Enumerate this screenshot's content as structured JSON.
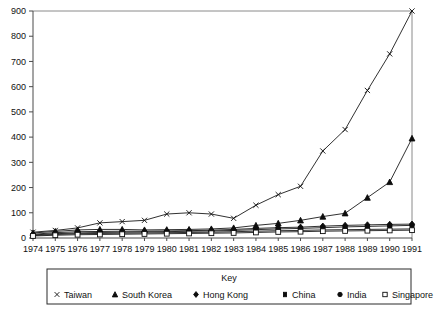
{
  "chart_data": {
    "type": "line",
    "title": "",
    "xlabel": "",
    "ylabel": "",
    "x": [
      1974,
      1975,
      1976,
      1977,
      1978,
      1979,
      1980,
      1981,
      1982,
      1983,
      1984,
      1985,
      1986,
      1987,
      1988,
      1989,
      1990,
      1991
    ],
    "categories": [
      "1974",
      "1975",
      "1976",
      "1977",
      "1978",
      "1979",
      "1980",
      "1981",
      "1982",
      "1983",
      "1984",
      "1985",
      "1986",
      "1987",
      "1988",
      "1989",
      "1990",
      "1991"
    ],
    "xlim": [
      1974,
      1991
    ],
    "ylim": [
      0,
      900
    ],
    "yticks": [
      0,
      100,
      200,
      300,
      400,
      500,
      600,
      700,
      800,
      900
    ],
    "grid": false,
    "legend_position": "bottom",
    "legend_title": "Key",
    "series": [
      {
        "name": "Taiwan",
        "marker": "x",
        "values": [
          23,
          30,
          40,
          60,
          65,
          70,
          95,
          100,
          95,
          78,
          130,
          172,
          205,
          345,
          430,
          585,
          730,
          900
        ]
      },
      {
        "name": "South Korea",
        "marker": "triangle",
        "values": [
          20,
          26,
          32,
          34,
          34,
          32,
          33,
          34,
          36,
          40,
          50,
          58,
          70,
          85,
          98,
          160,
          222,
          395
        ]
      },
      {
        "name": "Hong Kong",
        "marker": "diamond",
        "values": [
          15,
          21,
          25,
          26,
          27,
          27,
          28,
          29,
          31,
          34,
          38,
          41,
          43,
          47,
          50,
          52,
          54,
          55
        ]
      },
      {
        "name": "China",
        "marker": "small-square",
        "values": [
          10,
          14,
          17,
          18,
          19,
          20,
          21,
          22,
          23,
          25,
          27,
          29,
          30,
          32,
          33,
          34,
          35,
          36
        ]
      },
      {
        "name": "India",
        "marker": "circle",
        "values": [
          12,
          17,
          20,
          22,
          23,
          24,
          25,
          27,
          28,
          30,
          33,
          36,
          38,
          41,
          44,
          46,
          48,
          50
        ]
      },
      {
        "name": "Singapore",
        "marker": "open-square",
        "values": [
          8,
          11,
          13,
          14,
          15,
          16,
          17,
          18,
          19,
          20,
          22,
          24,
          25,
          27,
          28,
          29,
          30,
          31
        ]
      }
    ]
  },
  "legend": {
    "title": "Key",
    "entries": [
      {
        "label": "Taiwan",
        "marker": "x"
      },
      {
        "label": "South Korea",
        "marker": "triangle"
      },
      {
        "label": "Hong Kong",
        "marker": "diamond"
      },
      {
        "label": "China",
        "marker": "small-square"
      },
      {
        "label": "India",
        "marker": "circle"
      },
      {
        "label": "Singapore",
        "marker": "open-square"
      }
    ]
  },
  "axes": {
    "y_tick_labels": [
      "900",
      "800",
      "700",
      "600",
      "500",
      "400",
      "300",
      "200",
      "100",
      "0"
    ],
    "x_tick_labels": [
      "1974",
      "1975",
      "1976",
      "1977",
      "1978",
      "1979",
      "1980",
      "1981",
      "1982",
      "1983",
      "1984",
      "1985",
      "1986",
      "1987",
      "1988",
      "1989",
      "1990",
      "1991"
    ]
  },
  "colors": {
    "line": "#1a1a1a",
    "axis": "#4a4a4a",
    "frame": "#8a8a8a",
    "background": "#ffffff",
    "text": "#111111"
  }
}
